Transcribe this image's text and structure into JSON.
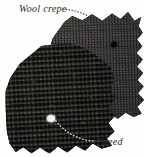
{
  "figure": {
    "kind": "fabric-swatch-photo",
    "background_color": "#fdfdfb",
    "width": 144,
    "height": 157
  },
  "labels": {
    "wool_crepe": "Wool crepe",
    "tweed": "Tweed",
    "text_color": "#2b2926"
  },
  "swatches": [
    {
      "id": "wool-crepe",
      "name": "Wool crepe",
      "position": "top-right",
      "edge": "pinked-zigzag",
      "base_color": "#2a2725",
      "texture": "fine flat crepe weave",
      "marking": "small dark hole"
    },
    {
      "id": "tweed",
      "name": "Tweed",
      "position": "bottom-left",
      "edge": "pinked-scalloped",
      "base_color": "#1d1b19",
      "texture": "nubby looped boucle tweed",
      "marking": "light loop highlight"
    }
  ],
  "leaders": [
    {
      "id": "wool-crepe-leader",
      "style": "dotted",
      "from_label": "Wool crepe",
      "to_swatch": "wool-crepe",
      "color": "#3a3734"
    },
    {
      "id": "tweed-leader",
      "style": "dotted",
      "from_label": "Tweed",
      "to_swatch": "tweed",
      "color": "#e9e6e0"
    }
  ]
}
